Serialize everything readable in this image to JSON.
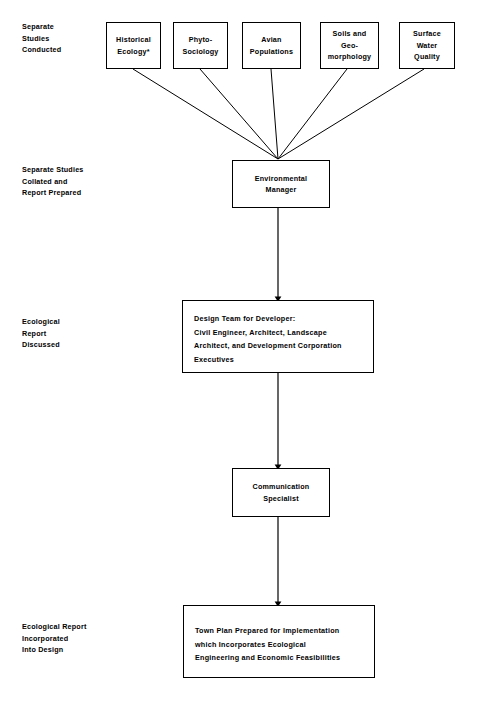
{
  "diagram": {
    "stage_labels": [
      {
        "id": "stage-studies-conducted",
        "text": "Separate\nStudies\nConducted"
      },
      {
        "id": "stage-studies-collated",
        "text": "Separate Studies\nCollated and\nReport Prepared"
      },
      {
        "id": "stage-report-discussed",
        "text": "Ecological\nReport\nDiscussed"
      },
      {
        "id": "stage-report-incorporated",
        "text": "Ecological Report\nIncorporated\nInto Design"
      }
    ],
    "study_boxes": [
      {
        "id": "box-historical-ecology",
        "text": "Historical\nEcology*"
      },
      {
        "id": "box-phyto-sociology",
        "text": "Phyto-\nSociology"
      },
      {
        "id": "box-avian-populations",
        "text": "Avian\nPopulations"
      },
      {
        "id": "box-soils-geomorphology",
        "text": "Soils and\nGeo-\nmorphology"
      },
      {
        "id": "box-surface-water-quality",
        "text": "Surface\nWater\nQuality"
      }
    ],
    "environmental_manager": {
      "text": "Environmental\nManager"
    },
    "design_team": {
      "text": "Design Team for Developer:\nCivil Engineer, Architect, Landscape\nArchitect, and Development Corporation\nExecutives"
    },
    "communication_specialist": {
      "text": "Communication\nSpecialist"
    },
    "town_plan": {
      "text": "Town Plan Prepared for Implementation\nwhich Incorporates Ecological\nEngineering and Economic Feasibilities"
    },
    "colors": {
      "stroke": "#000000",
      "background": "#ffffff",
      "text": "#000000"
    }
  }
}
